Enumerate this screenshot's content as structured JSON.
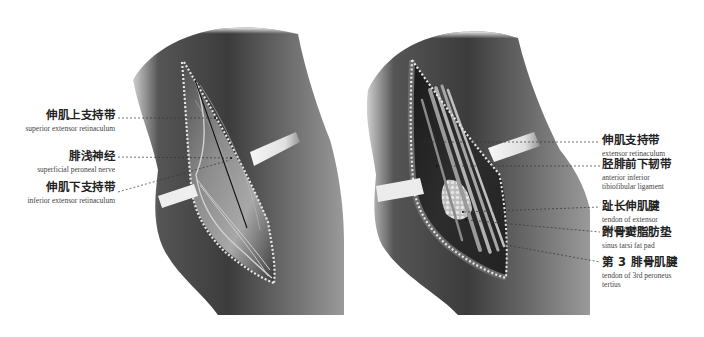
{
  "figure": {
    "panels": [
      {
        "id": "left",
        "description": "superficial layer — incision over anterolateral ankle",
        "labels": [
          {
            "zh": "伸肌上支持带",
            "en": [
              "superior extensor retinaculum"
            ]
          },
          {
            "zh": "腓浅神经",
            "en": [
              "superficial peroneal nerve"
            ]
          },
          {
            "zh": "伸肌下支持带",
            "en": [
              "inferior extensor retinaculum"
            ]
          }
        ]
      },
      {
        "id": "right",
        "description": "deep layer — retinaculum opened, tendons exposed",
        "labels": [
          {
            "zh": "伸肌支持带",
            "en": [
              "extensor retinaculum"
            ]
          },
          {
            "zh": "胫腓前下韧带",
            "en": [
              "anterior inferior",
              "tibiofibular ligament"
            ]
          },
          {
            "zh": "趾长伸肌腱",
            "en": [
              "tendon of extensor",
              "digitorum longus"
            ]
          },
          {
            "zh": "跗骨窦脂肪垫",
            "en": [
              "sinus tarsi fat pad"
            ]
          },
          {
            "zh": "第 3 腓骨肌腱",
            "en": [
              "tendon of 3rd peroneus",
              "tertius"
            ]
          }
        ]
      }
    ]
  },
  "colors": {
    "skin_dark": "#3a3a3a",
    "skin_mid": "#6a6a6a",
    "skin_light": "#9a9a9a",
    "retractor": "#e8e8e8",
    "suture": "#d8d8d8",
    "leader": "#333333"
  }
}
